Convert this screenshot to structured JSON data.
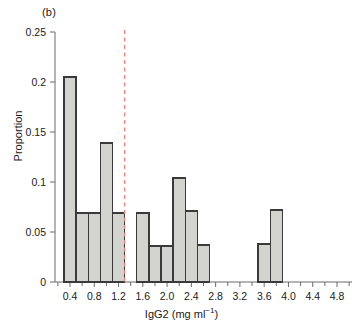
{
  "panel": {
    "label": "(b)"
  },
  "axes": {
    "ylabel": "Proportion",
    "xlabel_main": "IgG2 (mg ml",
    "xlabel_sup": "−1",
    "xlabel_close": ")",
    "xlabel_full": "IgG2 (mg ml−1)",
    "y_ticks": [
      "0",
      "0.05",
      "0.1",
      "0.15",
      "0.2",
      "0.25"
    ],
    "x_ticks": [
      "0.4",
      "0.8",
      "1.2",
      "1.6",
      "2.0",
      "2.4",
      "2.8",
      "3.2",
      "3.6",
      "4.0",
      "4.4",
      "4.8"
    ]
  },
  "colors": {
    "bar_fill": "#d3d3cf",
    "bar_stroke": "#3a3a3a",
    "axis": "#6b6b6b",
    "text": "#1a1a1a",
    "threshold_line": "#e8857a"
  },
  "chart_data": {
    "type": "bar",
    "title": "(b)",
    "xlabel": "IgG2 (mg ml−1)",
    "ylabel": "Proportion",
    "xlim": [
      0.2,
      5.0
    ],
    "ylim": [
      0,
      0.25
    ],
    "grid": false,
    "legend": null,
    "bin_width": 0.2,
    "bin_starts": [
      0.3,
      0.5,
      0.7,
      0.9,
      1.1,
      1.5,
      1.7,
      1.9,
      2.1,
      2.3,
      2.5,
      3.5,
      3.7
    ],
    "bin_centers": [
      0.4,
      0.6,
      0.8,
      1.0,
      1.2,
      1.6,
      1.8,
      2.0,
      2.2,
      2.4,
      2.6,
      3.6,
      3.8
    ],
    "values": [
      0.205,
      0.069,
      0.069,
      0.139,
      0.069,
      0.069,
      0.036,
      0.036,
      0.104,
      0.071,
      0.037,
      0.038,
      0.072
    ],
    "annotations": [
      {
        "name": "threshold-line",
        "type": "vline",
        "x": 1.3,
        "style": "dashed",
        "color": "#e8857a"
      }
    ]
  }
}
